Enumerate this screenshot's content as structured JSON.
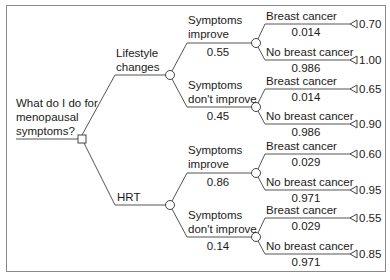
{
  "root": {
    "question": "What do I do for menopausal symptoms?",
    "question_lines": [
      "What do I do for",
      "menopausal",
      "symptoms?"
    ]
  },
  "decisions": [
    {
      "label_lines": [
        "Lifestyle",
        "changes"
      ],
      "branches": [
        {
          "label_lines": [
            "Symptoms",
            "improve"
          ],
          "prob": "0.55",
          "outcomes": [
            {
              "label": "Breast cancer",
              "prob": "0.014",
              "utility": "0.70"
            },
            {
              "label": "No breast cancer",
              "prob": "0.986",
              "utility": "1.00"
            }
          ]
        },
        {
          "label_lines": [
            "Symptoms",
            "don't improve"
          ],
          "prob": "0.45",
          "outcomes": [
            {
              "label": "Breast cancer",
              "prob": "0.014",
              "utility": "0.65"
            },
            {
              "label": "No breast cancer",
              "prob": "0.986",
              "utility": "0.90"
            }
          ]
        }
      ]
    },
    {
      "label_lines": [
        "HRT"
      ],
      "branches": [
        {
          "label_lines": [
            "Symptoms",
            "improve"
          ],
          "prob": "0.86",
          "outcomes": [
            {
              "label": "Breast cancer",
              "prob": "0.029",
              "utility": "0.60"
            },
            {
              "label": "No breast cancer",
              "prob": "0.971",
              "utility": "0.95"
            }
          ]
        },
        {
          "label_lines": [
            "Symptoms",
            "don't improve"
          ],
          "prob": "0.14",
          "outcomes": [
            {
              "label": "Breast cancer",
              "prob": "0.029",
              "utility": "0.55"
            },
            {
              "label": "No breast cancer",
              "prob": "0.971",
              "utility": "0.85"
            }
          ]
        }
      ]
    }
  ],
  "colors": {
    "line": "#555555",
    "border": "#8a8a8a"
  }
}
